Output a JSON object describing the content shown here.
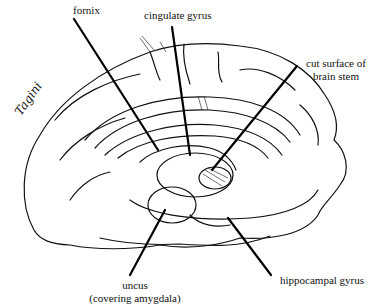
{
  "diagram": {
    "signature": "Tagini",
    "labels": [
      {
        "id": "fornix",
        "text": "fornix"
      },
      {
        "id": "cingulate",
        "text": "cingulate gyrus"
      },
      {
        "id": "cut_surface",
        "line1": "cut surface of",
        "line2": "brain stem"
      },
      {
        "id": "uncus",
        "line1": "uncus",
        "line2": "(covering amygdala)"
      },
      {
        "id": "hippocampal",
        "text": "hippocampal gyrus"
      }
    ]
  }
}
